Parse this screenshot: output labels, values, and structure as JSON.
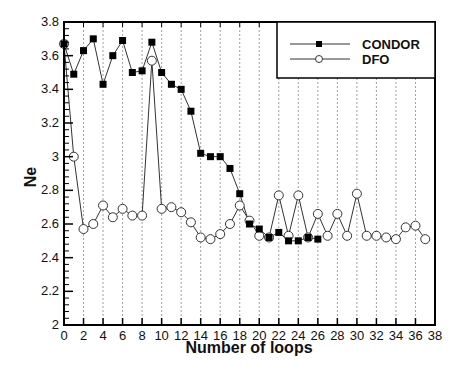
{
  "chart_data": {
    "type": "line",
    "title": "",
    "xlabel": "Number of loops",
    "ylabel": "Ne",
    "xlim": [
      0,
      38
    ],
    "ylim": [
      2,
      3.8
    ],
    "xticks": [
      0,
      2,
      4,
      6,
      8,
      10,
      12,
      14,
      16,
      18,
      20,
      22,
      24,
      26,
      28,
      30,
      32,
      34,
      36,
      38
    ],
    "yticks": [
      2,
      2.2,
      2.4,
      2.6,
      2.8,
      3,
      3.2,
      3.4,
      3.6,
      3.8
    ],
    "ytick_labels": [
      "2",
      "2.2",
      "2.4",
      "2.6",
      "2.8",
      "3",
      "3.2",
      "3.4",
      "3.6",
      "3.8"
    ],
    "grid": "vertical dashed lines at even x ticks",
    "legend_position": "upper right",
    "series": [
      {
        "name": "CONDOR",
        "marker": "filled-square",
        "x": [
          0,
          1,
          2,
          3,
          4,
          5,
          6,
          7,
          8,
          9,
          10,
          11,
          12,
          13,
          14,
          15,
          16,
          17,
          18,
          19,
          20,
          21,
          22,
          23,
          24,
          25,
          26
        ],
        "values": [
          3.67,
          3.49,
          3.63,
          3.7,
          3.43,
          3.6,
          3.69,
          3.5,
          3.51,
          3.68,
          3.5,
          3.43,
          3.4,
          3.27,
          3.02,
          3.0,
          3.0,
          2.93,
          2.78,
          2.6,
          2.57,
          2.52,
          2.55,
          2.5,
          2.5,
          2.52,
          2.51
        ]
      },
      {
        "name": "DFO",
        "marker": "open-circle",
        "x": [
          0,
          1,
          2,
          3,
          4,
          5,
          6,
          7,
          8,
          9,
          10,
          11,
          12,
          13,
          14,
          15,
          16,
          17,
          18,
          19,
          20,
          21,
          22,
          23,
          24,
          25,
          26,
          27,
          28,
          29,
          30,
          31,
          32,
          33,
          34,
          35,
          36,
          37
        ],
        "values": [
          3.67,
          3.0,
          2.57,
          2.6,
          2.71,
          2.64,
          2.69,
          2.65,
          2.65,
          3.57,
          2.69,
          2.7,
          2.67,
          2.61,
          2.52,
          2.51,
          2.54,
          2.6,
          2.71,
          2.62,
          2.53,
          2.52,
          2.77,
          2.53,
          2.77,
          2.52,
          2.66,
          2.53,
          2.66,
          2.53,
          2.78,
          2.53,
          2.53,
          2.52,
          2.51,
          2.58,
          2.59,
          2.51
        ]
      }
    ]
  },
  "legend": {
    "items": [
      {
        "label": "CONDOR"
      },
      {
        "label": "DFO"
      }
    ]
  },
  "colors": {
    "line": "#333333",
    "axis": "#000000",
    "grid": "#888888"
  }
}
